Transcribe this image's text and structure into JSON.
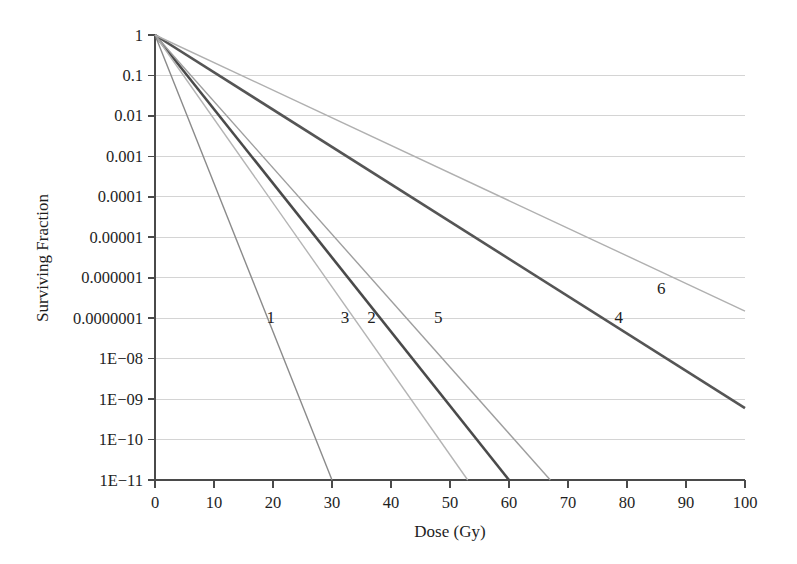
{
  "chart_data": {
    "type": "line",
    "title": "",
    "xlabel": "Dose (Gy)",
    "ylabel": "Surviving  Fraction",
    "xlim": [
      0,
      100
    ],
    "ylim": [
      1e-11,
      1
    ],
    "yscale": "log",
    "xscale": "linear",
    "grid": true,
    "legend_position": "inline-labels",
    "xticks": [
      0,
      10,
      20,
      30,
      40,
      50,
      60,
      70,
      80,
      90,
      100
    ],
    "xtick_labels": [
      "0",
      "10",
      "20",
      "30",
      "40",
      "50",
      "60",
      "70",
      "80",
      "90",
      "100"
    ],
    "yticks": [
      1,
      0.1,
      0.01,
      0.001,
      0.0001,
      1e-05,
      1e-06,
      1e-07,
      1e-08,
      1e-09,
      1e-10,
      1e-11
    ],
    "ytick_labels": [
      "1",
      "0.1",
      "0.01",
      "0.001",
      "0.0001",
      "0.00001",
      "0.000001",
      "0.0000001",
      "1E−08",
      "1E−09",
      "1E−10",
      "1E−11"
    ],
    "series": [
      {
        "name": "1",
        "label": "1",
        "color": "#8a8a8a",
        "width": 1.4,
        "x": [
          0,
          30
        ],
        "y": [
          1,
          1e-11
        ],
        "decades_per_Gy": 0.3667,
        "label_x": 19.6,
        "label_y": 1.1e-07
      },
      {
        "name": "2",
        "label": "2",
        "color": "#4a4a4a",
        "width": 2.6,
        "x": [
          0,
          60
        ],
        "y": [
          1,
          1e-11
        ],
        "decades_per_Gy": 0.1833,
        "label_x": 36.7,
        "label_y": 1.1e-07
      },
      {
        "name": "3",
        "label": "3",
        "color": "#b4b4b4",
        "width": 1.4,
        "x": [
          0,
          53
        ],
        "y": [
          1,
          1e-11
        ],
        "decades_per_Gy": 0.2075,
        "label_x": 32.2,
        "label_y": 1.1e-07
      },
      {
        "name": "4",
        "label": "4",
        "color": "#555555",
        "width": 2.6,
        "x": [
          0,
          100
        ],
        "y": [
          1,
          6e-10
        ],
        "decades_per_Gy": 0.0922,
        "label_x": 78.6,
        "label_y": 1.1e-07
      },
      {
        "name": "5",
        "label": "5",
        "color": "#9e9e9e",
        "width": 1.4,
        "x": [
          0,
          67
        ],
        "y": [
          1,
          1e-11
        ],
        "decades_per_Gy": 0.1642,
        "label_x": 48.0,
        "label_y": 1.1e-07
      },
      {
        "name": "6",
        "label": "6",
        "color": "#b0b0b0",
        "width": 1.4,
        "x": [
          0,
          100
        ],
        "y": [
          1,
          1.5e-07
        ],
        "decades_per_Gy": 0.0682,
        "label_x": 85.8,
        "label_y": 5.5e-07
      }
    ]
  },
  "axes": {
    "x_axis_name": "dose-axis",
    "y_axis_name": "surviving-fraction-axis"
  }
}
